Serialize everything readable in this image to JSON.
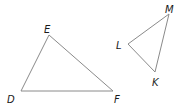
{
  "diagram": {
    "type": "geometry",
    "stroke_color": "#8a8a8a",
    "label_color": "#1a1a1a",
    "triangles": [
      {
        "name": "DEF",
        "vertices": [
          {
            "label": "D",
            "x": 21,
            "y": 91,
            "label_x": 7,
            "label_y": 103
          },
          {
            "label": "E",
            "x": 49,
            "y": 35,
            "label_x": 44,
            "label_y": 33
          },
          {
            "label": "F",
            "x": 113,
            "y": 91,
            "label_x": 114,
            "label_y": 103
          }
        ]
      },
      {
        "name": "LMK",
        "vertices": [
          {
            "label": "L",
            "x": 128,
            "y": 44,
            "label_x": 116,
            "label_y": 49
          },
          {
            "label": "M",
            "x": 169,
            "y": 14,
            "label_x": 165,
            "label_y": 13
          },
          {
            "label": "K",
            "x": 155,
            "y": 72,
            "label_x": 152,
            "label_y": 86
          }
        ]
      }
    ]
  }
}
